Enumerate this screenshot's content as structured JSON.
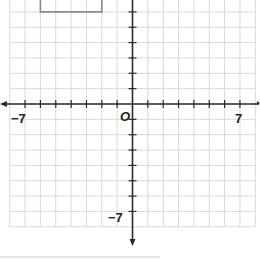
{
  "graph": {
    "type": "coordinate-plane",
    "x_range": [
      -8,
      8
    ],
    "y_range": [
      -8,
      6
    ],
    "unit_px": 15.35,
    "origin_px": [
      132.5,
      104
    ],
    "labels": {
      "origin": "O",
      "x_neg": "−7",
      "x_pos": "7",
      "y_neg": "−7"
    },
    "colors": {
      "grid": "#d9d9d9",
      "axis": "#2b2b2b",
      "rectangle": "#8a8a8a",
      "background": "#ffffff"
    },
    "rectangle": {
      "description": "partial rectangle outline at top-left, cut off by top edge",
      "x_from": -6,
      "x_to": -2,
      "y_bottom": 6
    }
  }
}
